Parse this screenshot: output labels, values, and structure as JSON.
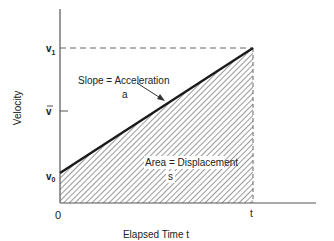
{
  "diagram": {
    "y_axis_label": "Velocity",
    "x_axis_label": "Elapsed Time t",
    "origin_label": "0",
    "t_label": "t",
    "v1_label": "v",
    "v1_sub": "1",
    "vbar_label": "v",
    "v0_label": "v",
    "v0_sub": "0",
    "slope_label": "Slope = Acceleration",
    "slope_symbol": "a",
    "area_label": "Area = Displacement",
    "area_symbol": "s",
    "colors": {
      "line": "#1a1a1a",
      "axis": "#555555",
      "hatch": "#555555",
      "background": "#ffffff"
    }
  }
}
